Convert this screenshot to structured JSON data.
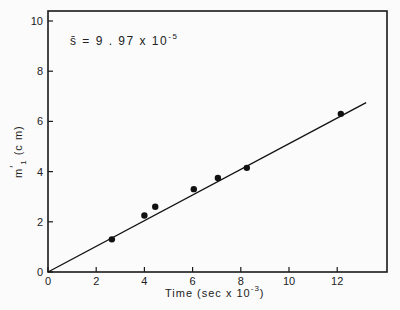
{
  "chart_data": {
    "type": "scatter",
    "title": "",
    "xlabel": "Time (sec x 10^-3)",
    "ylabel": "m'_1 (cm)",
    "xlim": [
      0,
      14
    ],
    "ylim": [
      0,
      10.4
    ],
    "xticks": [
      0,
      2,
      4,
      6,
      8,
      10,
      12
    ],
    "yticks": [
      0,
      2,
      4,
      6,
      8,
      10
    ],
    "grid": false,
    "legend": null,
    "annotations": [
      "s̄ = 9.97 x 10^-5"
    ],
    "series": [
      {
        "name": "measured",
        "type": "scatter",
        "x": [
          2.65,
          4.0,
          4.45,
          6.05,
          7.05,
          8.25,
          12.15
        ],
        "y": [
          1.3,
          2.25,
          2.6,
          3.3,
          3.75,
          4.15,
          6.3
        ]
      },
      {
        "name": "fit",
        "type": "line",
        "x": [
          0,
          13.2
        ],
        "y": [
          0,
          6.75
        ]
      }
    ]
  },
  "labels": {
    "xlabel_main": "Time  (sec x 10",
    "xlabel_exp": "-3",
    "xlabel_close": ")",
    "ylabel_main": "m",
    "ylabel_prime": "′",
    "ylabel_sub": "1",
    "ylabel_unit": "(c m)",
    "annot_main": "s̄  =  9 . 97  x  10",
    "annot_exp": "-5"
  },
  "xtick_labels": [
    "0",
    "2",
    "4",
    "6",
    "8",
    "10",
    "12"
  ],
  "ytick_labels": [
    "0",
    "2",
    "4",
    "6",
    "8",
    "10"
  ]
}
